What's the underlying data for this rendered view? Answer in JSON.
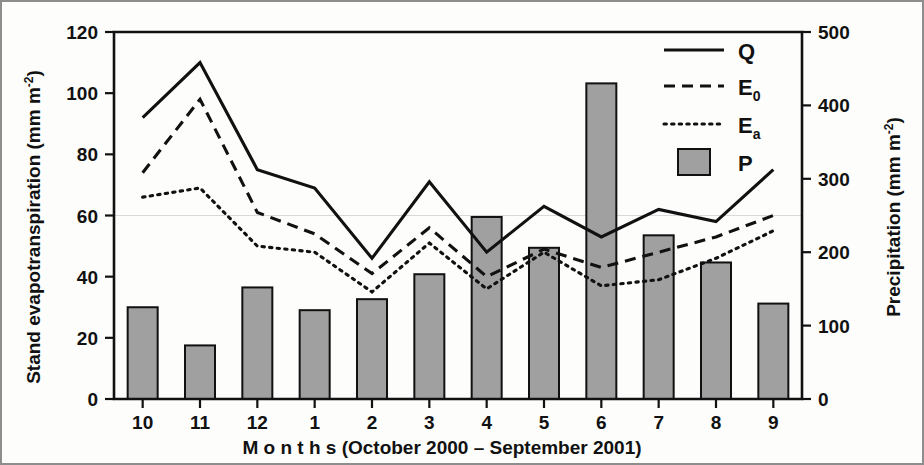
{
  "figure": {
    "background_color": "#fdfdfc",
    "border_color": "#8d8d8d",
    "ink_color": "#111111",
    "bar_fill_color": "#a0a0a0",
    "gridline_color": "#d9d9d9"
  },
  "axes": {
    "left": {
      "title_main": "Stand evapotranspiration (mm m",
      "title_sup": "-2",
      "title_close": ")",
      "ticks": [
        "0",
        "20",
        "40",
        "60",
        "80",
        "100",
        "120"
      ]
    },
    "right": {
      "title_main": "Precipitation (mm m",
      "title_sup": "-2",
      "title_close": ")",
      "ticks": [
        "0",
        "100",
        "200",
        "300",
        "400",
        "500"
      ]
    },
    "bottom": {
      "title": "M o n t h s  (October 2000 – September 2001)",
      "ticks": [
        "10",
        "11",
        "12",
        "1",
        "2",
        "3",
        "4",
        "5",
        "6",
        "7",
        "8",
        "9"
      ]
    }
  },
  "legend": {
    "items": [
      {
        "label": "Q",
        "sub": "",
        "style": "solid"
      },
      {
        "label": "E",
        "sub": "0",
        "style": "dashed"
      },
      {
        "label": "E",
        "sub": "a",
        "style": "dotted"
      },
      {
        "label": "P",
        "sub": "",
        "style": "bar"
      }
    ]
  },
  "chart_data": {
    "type": "bar",
    "title": "",
    "xlabel": "M o n t h s  (October 2000 – September 2001)",
    "ylabel": "Stand evapotranspiration (mm m-2)",
    "y2label": "Precipitation (mm m-2)",
    "categories": [
      "10",
      "11",
      "12",
      "1",
      "2",
      "3",
      "4",
      "5",
      "6",
      "7",
      "8",
      "9"
    ],
    "ylim": [
      0,
      120
    ],
    "y2lim": [
      0,
      500
    ],
    "yticks": [
      0,
      20,
      40,
      60,
      80,
      100,
      120
    ],
    "y2ticks": [
      0,
      100,
      200,
      300,
      400,
      500
    ],
    "grid": "single horizontal gridline at y=60 / y2=250",
    "legend_position": "top-right inside axes",
    "series": [
      {
        "name": "Q",
        "axis": "left",
        "style": "solid",
        "values": [
          92,
          110,
          75,
          69,
          46,
          71,
          48,
          63,
          53,
          62,
          58,
          75
        ]
      },
      {
        "name": "E0",
        "axis": "left",
        "style": "dashed",
        "values": [
          74,
          98,
          61,
          54,
          41,
          56,
          40,
          49,
          43,
          48,
          53,
          60
        ]
      },
      {
        "name": "Ea",
        "axis": "left",
        "style": "dotted",
        "values": [
          66,
          69,
          50,
          48,
          35,
          51,
          36,
          48,
          37,
          39,
          46,
          55
        ]
      },
      {
        "name": "P",
        "axis": "right",
        "style": "bar",
        "values": [
          125,
          73,
          152,
          121,
          136,
          170,
          248,
          206,
          430,
          223,
          186,
          130
        ]
      }
    ]
  }
}
